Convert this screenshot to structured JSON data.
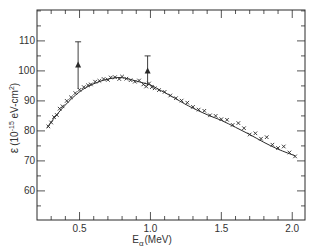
{
  "chart_data": {
    "type": "scatter",
    "title": "",
    "xlabel": "E_α (MeV)",
    "xlabel_main": "E",
    "xlabel_sub": "α",
    "xlabel_unit": "(MeV)",
    "ylabel": "ε (10⁻¹⁵ eV-cm²)",
    "ylabel_symbol": "ε",
    "ylabel_unit_prefix": "(10",
    "ylabel_exp": "-15",
    "ylabel_unit_suffix": " eV-cm",
    "ylabel_unit_exp": "2",
    "ylabel_close": ")",
    "xlim": [
      0.2,
      2.09
    ],
    "ylim": [
      50.3,
      120.3
    ],
    "grid": false,
    "legend": null,
    "x_ticks_major": [
      0.5,
      1.0,
      1.5,
      2.0
    ],
    "x_tick_labels": [
      "0.5",
      "1.0",
      "1.5",
      "2.0"
    ],
    "x_ticks_minor_step": 0.1,
    "y_ticks_major": [
      60,
      70,
      80,
      90,
      100,
      110
    ],
    "y_tick_labels": [
      "60",
      "70",
      "80",
      "90",
      "100",
      "110"
    ],
    "y_ticks_minor_step": 5,
    "series": [
      {
        "name": "fitted curve",
        "style": "line",
        "x": [
          0.27,
          0.35,
          0.45,
          0.54,
          0.65,
          0.75,
          0.82,
          0.9,
          1.0,
          1.06,
          1.15,
          1.27,
          1.4,
          1.5,
          1.6,
          1.7,
          1.8,
          1.9,
          2.02
        ],
        "y": [
          81.0,
          86.0,
          91.0,
          94.3,
          96.6,
          97.7,
          97.6,
          96.6,
          95.3,
          93.8,
          91.5,
          88.3,
          85.4,
          83.5,
          81.2,
          78.8,
          76.2,
          73.9,
          71.7
        ]
      },
      {
        "name": "measured points (x)",
        "style": "marker-x",
        "x": [
          0.28,
          0.3,
          0.32,
          0.34,
          0.36,
          0.38,
          0.41,
          0.44,
          0.47,
          0.5,
          0.53,
          0.56,
          0.58,
          0.61,
          0.64,
          0.67,
          0.7,
          0.72,
          0.75,
          0.78,
          0.8,
          0.83,
          0.86,
          0.89,
          0.92,
          0.95,
          0.97,
          0.99,
          1.01,
          1.03,
          1.06,
          1.1,
          1.14,
          1.18,
          1.22,
          1.26,
          1.3,
          1.34,
          1.38,
          1.42,
          1.46,
          1.5,
          1.54,
          1.58,
          1.62,
          1.66,
          1.7,
          1.74,
          1.78,
          1.82,
          1.86,
          1.9,
          1.94,
          1.98,
          2.02
        ],
        "y": [
          81.5,
          82.8,
          84.6,
          85.3,
          87.4,
          88.2,
          90.0,
          91.2,
          92.6,
          93.7,
          94.6,
          95.2,
          95.5,
          96.4,
          96.7,
          97.3,
          97.0,
          97.8,
          97.9,
          97.3,
          98.1,
          97.4,
          96.9,
          96.4,
          96.8,
          95.5,
          94.8,
          95.8,
          94.6,
          94.2,
          93.6,
          93.0,
          91.8,
          90.9,
          90.1,
          89.4,
          88.0,
          87.1,
          86.7,
          85.2,
          85.0,
          83.9,
          83.7,
          82.0,
          82.6,
          80.9,
          78.8,
          79.2,
          77.4,
          77.9,
          75.4,
          74.3,
          74.8,
          72.8,
          71.5
        ]
      },
      {
        "name": "measured points (triangles, with error bars)",
        "style": "marker-triangle",
        "x": [
          0.49,
          0.98
        ],
        "y": [
          102.0,
          100.0
        ],
        "err_upper": [
          109.7,
          105.0
        ],
        "err_lower": [
          94.0,
          95.0
        ]
      }
    ]
  }
}
